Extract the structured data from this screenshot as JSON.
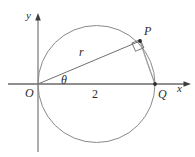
{
  "figure": {
    "kind": "geometry-diagram",
    "width": 195,
    "height": 157,
    "background_color": "#ffffff",
    "stroke_color": "#4a4a4a",
    "label_color": "#2b2b2b"
  },
  "axes": {
    "x_label": "x",
    "y_label": "y",
    "origin_label": "O",
    "x_axis": {
      "y": 84,
      "x_start": 8,
      "x_end": 190,
      "arrow": "right"
    },
    "y_axis": {
      "x": 38,
      "y_start": 152,
      "y_end": 14,
      "arrow": "up"
    }
  },
  "points": [
    {
      "name": "O",
      "label": "O",
      "x": 38,
      "y": 84,
      "marked": false
    },
    {
      "name": "P",
      "label": "P",
      "x": 140,
      "y": 41,
      "marked": true
    },
    {
      "name": "Q",
      "label": "Q",
      "x": 155,
      "y": 84,
      "marked": true
    }
  ],
  "circle": {
    "center_x": 96.5,
    "center_y": 84,
    "radius": 58.5,
    "passes_through": [
      "O",
      "Q"
    ]
  },
  "segments": [
    {
      "name": "OP",
      "label": "r",
      "from": "O",
      "to": "P"
    },
    {
      "name": "PQ",
      "label": "",
      "from": "P",
      "to": "Q"
    },
    {
      "name": "OQ",
      "label": "2",
      "from": "O",
      "to": "Q"
    }
  ],
  "annotations": {
    "radius_label": "r",
    "angle_label": "θ",
    "diameter_label": "2",
    "right_angle_at": "P",
    "right_angle_marker": {
      "x": 132,
      "y": 43,
      "size": 9,
      "rotation": -23
    }
  }
}
